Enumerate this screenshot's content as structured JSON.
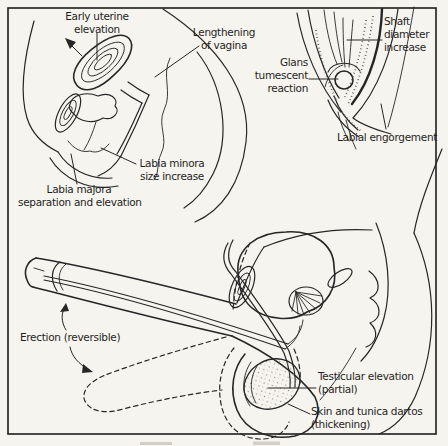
{
  "figure": {
    "kind": "anatomical line diagram of sexual-response excitement phase, scanned textbook figure",
    "colors": {
      "background": "#f6f4ee",
      "line": "#262626",
      "text": "#1f1f1f"
    },
    "panels": {
      "female_pelvis": {
        "labels": {
          "early_uterine_elevation": [
            "Early uterine",
            "elevation"
          ],
          "lengthening_of_vagina": [
            "Lengthening",
            "of vagina"
          ],
          "labia_minora_size_increase": [
            "Labia minora",
            "size increase"
          ],
          "labia_majora_separation": [
            "Labia majora",
            "separation and elevation"
          ]
        }
      },
      "vulva_detail": {
        "labels": {
          "shaft_diameter_increase": [
            "Shaft",
            "diameter",
            "increase"
          ],
          "glans_tumescent_reaction": [
            "Glans",
            "tumescent",
            "reaction"
          ],
          "labial_engorgement": [
            "Labial engorgement"
          ]
        }
      },
      "male_pelvis": {
        "labels": {
          "erection_reversible": [
            "Erection (reversible)"
          ],
          "testicular_elevation": [
            "Testicular elevation",
            "(partial)"
          ],
          "skin_tunica_dartos": [
            "Skin and tunica dartos",
            "(thickening)"
          ]
        }
      }
    }
  }
}
